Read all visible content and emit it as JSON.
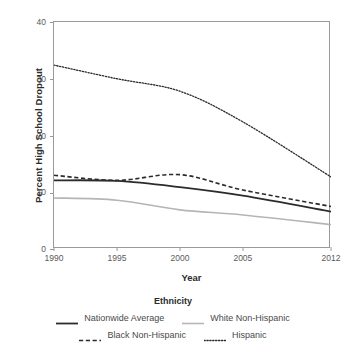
{
  "chart_data": {
    "type": "line",
    "title": "",
    "xlabel": "Year",
    "ylabel": "Percent High School Dropout",
    "legend_title": "Ethnicity",
    "legend_position": "bottom",
    "grid": false,
    "xlim": [
      1990,
      2012
    ],
    "ylim": [
      0,
      40
    ],
    "yticks": [
      0,
      10,
      20,
      30,
      40
    ],
    "xticks": [
      1990,
      1995,
      2000,
      2005,
      2012
    ],
    "xticklabels": [
      "1990",
      "1995",
      "2000",
      "2005",
      "2012"
    ],
    "yticklabels": [
      "0",
      "10",
      "20",
      "30",
      "40"
    ],
    "x": [
      1990,
      1995,
      2000,
      2005,
      2012
    ],
    "series": [
      {
        "name": "Nationwide Average",
        "values": [
          12.1,
          12.0,
          10.9,
          9.4,
          6.6
        ],
        "style": "solid",
        "color": "#2b2b2b",
        "width": 1.8
      },
      {
        "name": "White Non-Hispanic",
        "values": [
          9.0,
          8.6,
          6.9,
          6.0,
          4.3
        ],
        "style": "solid",
        "color": "#b5b5b5",
        "width": 1.6
      },
      {
        "name": "Black Non-Hispanic",
        "values": [
          13.0,
          12.1,
          13.1,
          10.4,
          7.5
        ],
        "style": "dashed",
        "color": "#2b2b2b",
        "width": 1.6
      },
      {
        "name": "Hispanic",
        "values": [
          32.4,
          30.0,
          27.8,
          22.4,
          12.7
        ],
        "style": "dotted",
        "color": "#2b2b2b",
        "width": 1.3
      }
    ]
  },
  "axes": {
    "frame_color": "#9a9a9a",
    "tick_text_color": "#5a5a5a"
  }
}
